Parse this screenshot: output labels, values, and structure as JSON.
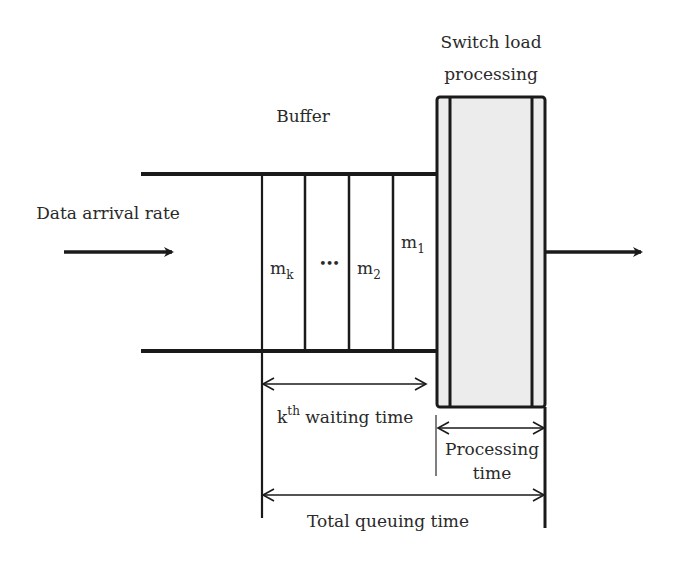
{
  "labels": {
    "switch_title_line1": "Switch load",
    "switch_title_line2": "processing",
    "buffer": "Buffer",
    "data_arrival": "Data arrival rate",
    "slot_mk_base": "m",
    "slot_mk_sub": "k",
    "slot_dots": "•••",
    "slot_m2_base": "m",
    "slot_m2_sub": "2",
    "slot_m1_base": "m",
    "slot_m1_sub": "1",
    "waiting_k": "k",
    "waiting_sup": "th",
    "waiting_rest": " waiting time",
    "processing_line1": "Processing",
    "processing_line2": "time",
    "total_queuing": "Total queuing time"
  },
  "colors": {
    "line": "#1a1a1a",
    "switch_fill": "#ececec",
    "text": "#2a2a2a"
  }
}
